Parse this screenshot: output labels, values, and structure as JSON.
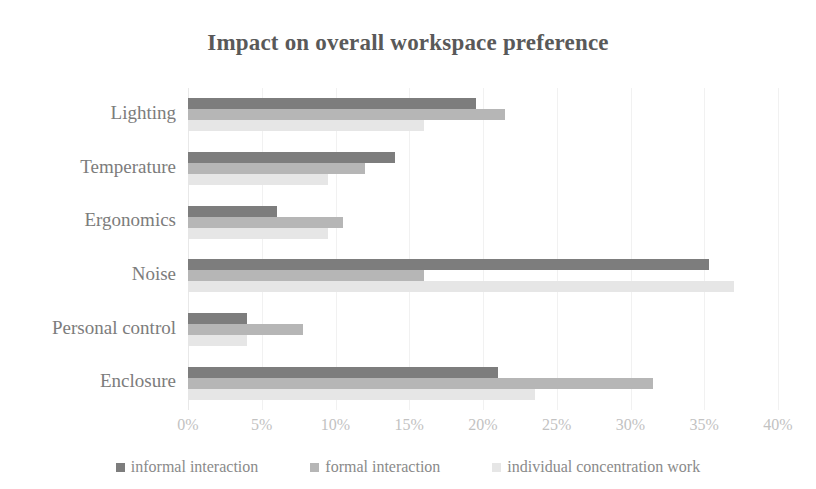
{
  "chart_data": {
    "type": "bar",
    "orientation": "horizontal",
    "title": "Impact on overall workspace preference",
    "xlabel": "",
    "ylabel": "",
    "xlim": [
      0,
      40
    ],
    "xtick_labels": [
      "0%",
      "5%",
      "10%",
      "15%",
      "20%",
      "25%",
      "30%",
      "35%",
      "40%"
    ],
    "xtick_values": [
      0,
      5,
      10,
      15,
      20,
      25,
      30,
      35,
      40
    ],
    "grid": true,
    "legend_position": "bottom",
    "categories": [
      "Lighting",
      "Temperature",
      "Ergonomics",
      "Noise",
      "Personal control",
      "Enclosure"
    ],
    "series": [
      {
        "name": "informal interaction",
        "color": "#7d7d7d",
        "values": [
          19.5,
          14.0,
          6.0,
          35.3,
          4.0,
          21.0
        ]
      },
      {
        "name": "formal interaction",
        "color": "#b6b6b6",
        "values": [
          21.5,
          12.0,
          10.5,
          16.0,
          7.8,
          31.5
        ]
      },
      {
        "name": "individual concentration work",
        "color": "#e6e6e6",
        "values": [
          16.0,
          9.5,
          9.5,
          37.0,
          4.0,
          23.5
        ]
      }
    ]
  },
  "style": {
    "title_color": "#595959",
    "label_color": "#7c7c7c",
    "tick_color": "#c2c2c2",
    "grid_color": "#f1f1f1",
    "background": "#ffffff"
  }
}
